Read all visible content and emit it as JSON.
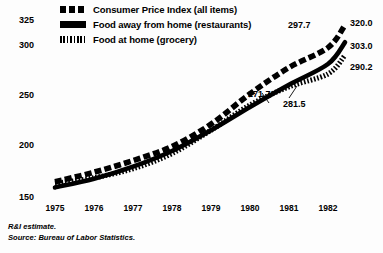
{
  "legend": {
    "items": [
      {
        "label": "Consumer Price Index (all items)",
        "swatch": "dashed-line-swatch"
      },
      {
        "label": "Food away from home (restaurants)",
        "swatch": "solid-line-swatch"
      },
      {
        "label": "Food at home (grocery)",
        "swatch": "hatched-line-swatch"
      }
    ]
  },
  "footnotes": {
    "line1": "R&I estimate.",
    "line2": "Source: Bureau of Labor Statistics."
  },
  "chart_data": {
    "type": "line",
    "title": "",
    "xlabel": "",
    "ylabel": "",
    "x": [
      1975,
      1976,
      1977,
      1978,
      1979,
      1980,
      1981,
      1982
    ],
    "xticklabels": [
      "1975",
      "1976",
      "1977",
      "1978",
      "1979",
      "1980",
      "1981",
      "1982"
    ],
    "yticks": [
      150,
      200,
      250,
      300,
      325
    ],
    "yticklabels": [
      "150",
      "200",
      "250",
      "300",
      "325"
    ],
    "ylim": [
      150,
      332
    ],
    "xlim": [
      1974.7,
      1982.4
    ],
    "grid": false,
    "legend_position": "top-center",
    "series": [
      {
        "name": "Consumer Price Index (all items)",
        "style": "dashed",
        "values": [
          165.0,
          174.5,
          186.0,
          200.0,
          222.0,
          252.0,
          278.0,
          297.7
        ],
        "end_label": "320.0"
      },
      {
        "name": "Food away from home (restaurants)",
        "style": "solid",
        "values": [
          159.5,
          168.0,
          180.0,
          195.5,
          216.0,
          239.0,
          261.0,
          281.5
        ],
        "end_label": "303.0"
      },
      {
        "name": "Food at home (grocery)",
        "style": "hatched",
        "values": [
          163.5,
          169.0,
          178.0,
          193.0,
          216.0,
          241.0,
          259.0,
          271.7
        ],
        "end_label": "290.2"
      }
    ],
    "annotations": [
      {
        "text": "297.7",
        "series": "Consumer Price Index (all items)",
        "value": 297.7
      },
      {
        "text": "320.0",
        "series": "Consumer Price Index (all items)",
        "value": 320.0
      },
      {
        "text": "303.0",
        "series": "Food away from home (restaurants)",
        "value": 303.0
      },
      {
        "text": "290.2",
        "series": "Food at home (grocery)",
        "value": 290.2
      },
      {
        "text": "271.7",
        "series": "Food at home (grocery)",
        "value": 271.7
      },
      {
        "text": "281.5",
        "series": "Food away from home (restaurants)",
        "value": 281.5
      }
    ]
  }
}
